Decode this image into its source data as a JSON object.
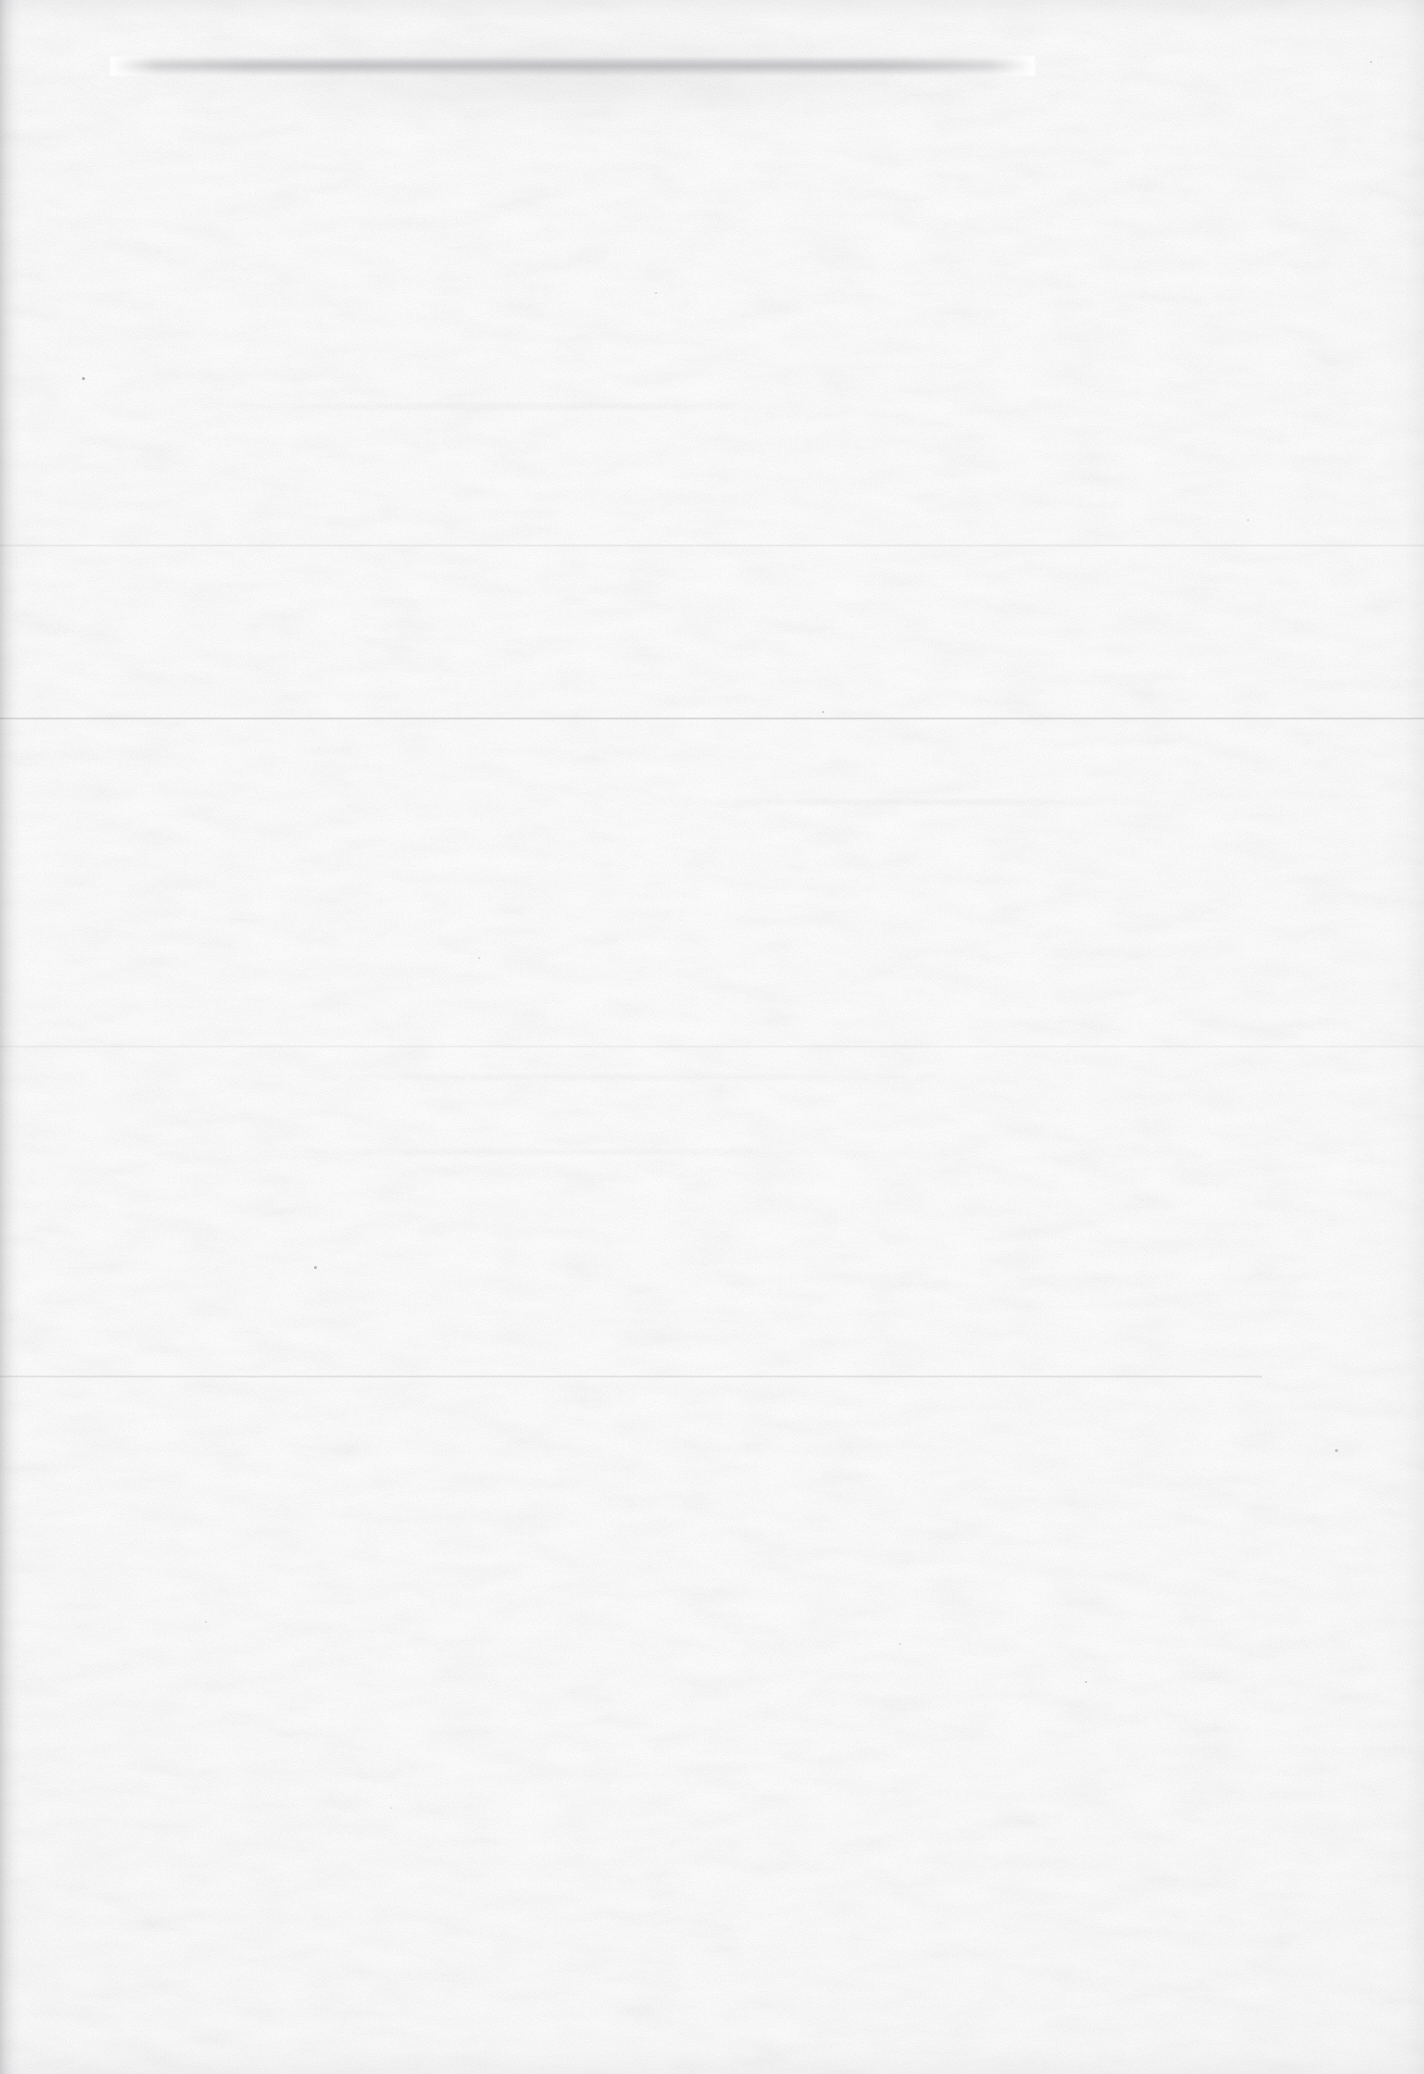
{
  "document": {
    "kind": "scanned-page",
    "content_state": "blank",
    "page_width": 1424,
    "page_height": 2074,
    "background_color": "#fdfdfd",
    "paper_tone": "#fbfbfb",
    "visible_text": "",
    "text_blocks": [],
    "figures": [],
    "tables": []
  },
  "artifacts": {
    "description": "Physical scan artifacts only; no printed or handwritten content is legible on this page.",
    "smudge_band": {
      "name": "top-smudge-band",
      "x": 110,
      "y": 56,
      "width": 925,
      "height": 20,
      "color": "#83838a",
      "opacity": 0.42
    },
    "smudge_haze": {
      "name": "top-smudge-haze",
      "x": 60,
      "y": 20,
      "width": 1050,
      "height": 110,
      "color": "#aaaab0"
    },
    "creases": [
      {
        "name": "crease-line-1",
        "y": 545,
        "x": 0,
        "width": 1424,
        "opacity": 0.16,
        "color": "#9a9aa2"
      },
      {
        "name": "crease-line-2",
        "y": 718,
        "x": 0,
        "width": 1424,
        "opacity": 0.3,
        "color": "#85858e"
      },
      {
        "name": "crease-line-3",
        "y": 1046,
        "x": 0,
        "width": 1424,
        "opacity": 0.13,
        "color": "#a0a0a8"
      },
      {
        "name": "crease-line-4",
        "y": 1376,
        "x": 0,
        "width": 1262,
        "opacity": 0.22,
        "color": "#8e8e97"
      }
    ],
    "gutter_shadow": {
      "name": "left-gutter-shadow",
      "edge": "left",
      "width": 26,
      "color": "#78787d"
    },
    "streaks": [
      {
        "name": "scan-streak-1",
        "x": 180,
        "y": 404,
        "width": 620,
        "height": 5
      },
      {
        "name": "scan-streak-2",
        "x": 640,
        "y": 800,
        "width": 540,
        "height": 4
      },
      {
        "name": "scan-streak-3",
        "x": 250,
        "y": 1075,
        "width": 700,
        "height": 4
      },
      {
        "name": "scan-streak-4",
        "x": 300,
        "y": 1150,
        "width": 560,
        "height": 4
      }
    ],
    "specks": [
      {
        "name": "dust-speck",
        "x": 82,
        "y": 377,
        "size": 3,
        "color": "#6e6e75",
        "opacity": 0.55
      },
      {
        "name": "dust-speck",
        "x": 314,
        "y": 1266,
        "size": 3,
        "color": "#70707a",
        "opacity": 0.5
      },
      {
        "name": "dust-speck",
        "x": 1335,
        "y": 1449,
        "size": 3,
        "color": "#75757e",
        "opacity": 0.45
      },
      {
        "name": "dust-speck",
        "x": 822,
        "y": 711,
        "size": 2,
        "color": "#7a7a83",
        "opacity": 0.4
      },
      {
        "name": "dust-speck",
        "x": 478,
        "y": 957,
        "size": 2,
        "color": "#80808a",
        "opacity": 0.34
      },
      {
        "name": "dust-speck",
        "x": 1085,
        "y": 1681,
        "size": 2,
        "color": "#7e7e88",
        "opacity": 0.36
      },
      {
        "name": "dust-speck",
        "x": 899,
        "y": 1643,
        "size": 2,
        "color": "#84848d",
        "opacity": 0.3
      },
      {
        "name": "dust-speck",
        "x": 655,
        "y": 292,
        "size": 2,
        "color": "#86868f",
        "opacity": 0.28
      },
      {
        "name": "dust-speck",
        "x": 1247,
        "y": 519,
        "size": 2,
        "color": "#83838c",
        "opacity": 0.3
      },
      {
        "name": "dust-speck",
        "x": 205,
        "y": 1621,
        "size": 2,
        "color": "#87878f",
        "opacity": 0.26
      },
      {
        "name": "dust-speck",
        "x": 1370,
        "y": 61,
        "size": 2,
        "color": "#7c7c86",
        "opacity": 0.34
      },
      {
        "name": "dust-speck",
        "x": 390,
        "y": 1807,
        "size": 2,
        "color": "#8a8a92",
        "opacity": 0.24
      }
    ]
  }
}
